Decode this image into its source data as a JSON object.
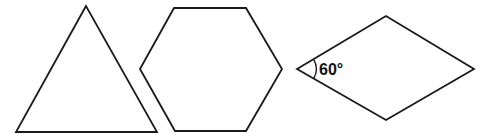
{
  "diagram": {
    "shapes": [
      {
        "name": "equilateral-triangle",
        "type": "triangle",
        "points": [
          [
            86,
            6
          ],
          [
            16,
            132
          ],
          [
            157,
            132
          ]
        ]
      },
      {
        "name": "regular-hexagon",
        "type": "hexagon",
        "points": [
          [
            174,
            8
          ],
          [
            246,
            8
          ],
          [
            282,
            69
          ],
          [
            246,
            131
          ],
          [
            175,
            131
          ],
          [
            140,
            69
          ]
        ]
      },
      {
        "name": "rhombus",
        "type": "rhombus",
        "points": [
          [
            297,
            69
          ],
          [
            386,
            16
          ],
          [
            474,
            69
          ],
          [
            386,
            120
          ]
        ]
      }
    ],
    "angle_annotation": {
      "label": "60°",
      "vertex": [
        297,
        69
      ]
    },
    "colors": {
      "stroke": "#1a1a1a",
      "background": "#ffffff"
    }
  }
}
